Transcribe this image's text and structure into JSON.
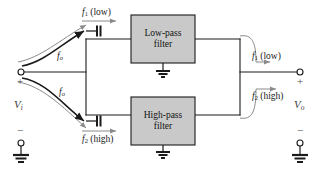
{
  "diagram": {
    "colors": {
      "wire": "#1a1a1a",
      "box_fill": "#c9c9c9",
      "box_stroke": "#1a1a1a",
      "text": "#1a1a1a",
      "thin_curve": "#8a8a8a",
      "thick_curve": "#1a1a1a",
      "background": "#ffffff"
    },
    "blocks": [
      {
        "id": "low_pass",
        "label_line1": "Low-pass",
        "label_line2": "filter"
      },
      {
        "id": "high_pass",
        "label_line1": "High-pass",
        "label_line2": "filter"
      }
    ],
    "input_port": {
      "source_label": "V",
      "source_sub": "i",
      "plus": "+",
      "minus": "−"
    },
    "output_port": {
      "load_label": "V",
      "load_sub": "o",
      "plus": "+",
      "minus": "−"
    },
    "signal_labels": {
      "input_top_f1": "f",
      "input_top_f1_sub": "1",
      "input_top_f1_paren": " (low)",
      "input_bottom_f2": "f",
      "input_bottom_f2_sub": "2",
      "input_bottom_f2_paren": " (high)",
      "source_top_fo": "f",
      "source_top_fo_sub": "o",
      "source_bottom_fo": "f",
      "source_bottom_fo_sub": "o",
      "output_top_f1": "f",
      "output_top_f1_sub": "1",
      "output_top_f1_paren": " (low)",
      "output_bottom_f2": "f",
      "output_bottom_f2_sub": "2",
      "output_bottom_f2_paren": " (high)"
    },
    "components": [
      {
        "id": "coupling-cap-top",
        "type": "capacitor"
      },
      {
        "id": "coupling-cap-bottom",
        "type": "capacitor"
      }
    ],
    "grounds": [
      {
        "id": "ground-low-pass"
      },
      {
        "id": "ground-high-pass"
      },
      {
        "id": "ground-input"
      },
      {
        "id": "ground-output"
      }
    ]
  }
}
